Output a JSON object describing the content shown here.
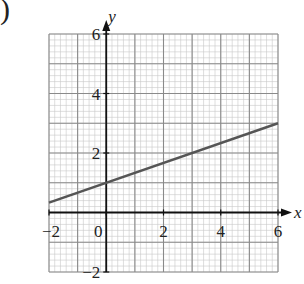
{
  "label_prefix": ")",
  "chart_data": {
    "type": "line",
    "title": "",
    "xlabel": "x",
    "ylabel": "y",
    "xlim": [
      -2,
      6
    ],
    "ylim": [
      -2,
      6
    ],
    "grid": true,
    "grid_major_step": 1,
    "grid_minor_step": 0.2,
    "x_ticks": [
      -2,
      0,
      2,
      4,
      6
    ],
    "y_ticks": [
      -2,
      2,
      4,
      6
    ],
    "x_tick_labels": [
      "−2",
      "0",
      "2",
      "4",
      "6"
    ],
    "y_tick_labels": [
      "−2",
      "2",
      "4",
      "6"
    ],
    "series": [
      {
        "name": "y = x/3 + 1",
        "x": [
          -2,
          6
        ],
        "y": [
          0.333,
          3
        ],
        "color": "#555555"
      }
    ],
    "colors": {
      "grid_minor": "#c8c8c8",
      "grid_major": "#8a8a8a",
      "axis": "#111111",
      "line": "#555555"
    }
  }
}
